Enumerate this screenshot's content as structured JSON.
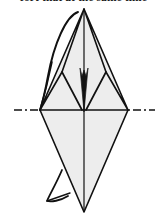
{
  "page": {
    "width": 167,
    "height": 216,
    "background_color": "#ffffff",
    "kind": "line-diagram"
  },
  "caption": {
    "text": "fort that at the same time",
    "note": "partially clipped text strip at very top edge of image",
    "color": "#1a1a1a"
  },
  "figure": {
    "stroke_color": "#111111",
    "fill_color": "#ededed",
    "wedge_color": "#141414",
    "centerline_color": "#111111",
    "axis": {
      "top_apex": {
        "x": 84,
        "y": 9
      },
      "bottom_apex": {
        "x": 84,
        "y": 212
      },
      "left_vertex": {
        "x": 40,
        "y": 110
      },
      "right_vertex": {
        "x": 128,
        "y": 110
      },
      "notch_left_shoulder": {
        "x": 62,
        "y": 72
      },
      "notch_right_shoulder": {
        "x": 106,
        "y": 72
      },
      "notch_bottom": {
        "x": 84,
        "y": 112
      }
    },
    "centerline": {
      "y": 110,
      "left_segment_start_x": 14,
      "left_segment_end_x": 40,
      "right_segment_start_x": 128,
      "right_segment_end_x": 155,
      "pattern": "dash-dot-dash"
    },
    "labels": []
  }
}
